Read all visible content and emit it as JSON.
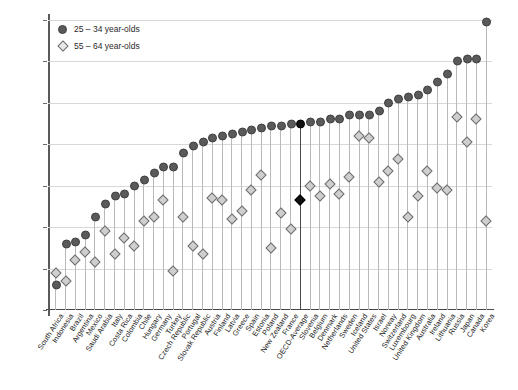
{
  "chart_data": {
    "type": "scatter",
    "title": "",
    "subtitle": "",
    "xlabel": "",
    "ylabel": "",
    "ylim": [
      0,
      70
    ],
    "yticks": [
      0,
      10,
      20,
      30,
      40,
      50,
      60,
      70
    ],
    "grid": true,
    "legend_position": "top-left",
    "highlight_category": "OECD-Average",
    "legend": [
      {
        "name": "25 – 34 year-olds",
        "marker": "filled-circle",
        "color": "#5a5a5a"
      },
      {
        "name": "55 – 64 year-olds",
        "marker": "open-diamond",
        "color": "#cfcfcf"
      }
    ],
    "categories": [
      "South Africa",
      "Indonesia",
      "Brazil",
      "Argentina",
      "Mexico",
      "Saudi Arabia",
      "Italy",
      "Costa Rica",
      "Colombia",
      "Chile",
      "Hungary",
      "Germany",
      "Turkey",
      "Czech Republic",
      "Portugal",
      "Slovak Republic",
      "Austria",
      "Finland",
      "Latvia",
      "Greece",
      "Spain",
      "Estonia",
      "Poland",
      "New Zealand",
      "France",
      "OECD-Average",
      "Slovenia",
      "Belgium",
      "Denmark",
      "Netherlands",
      "Sweden",
      "Iceland",
      "United States",
      "Israel",
      "Norway",
      "Switzerland",
      "Luxembourg",
      "United Kingdom",
      "Australia",
      "Ireland",
      "Lithuania",
      "Russia",
      "Japan",
      "Canada",
      "Korea"
    ],
    "series": [
      {
        "name": "25 – 34 year-olds",
        "marker": "filled-circle",
        "values": [
          6,
          16,
          16.5,
          18,
          22.5,
          25.5,
          27.5,
          28,
          30,
          31.5,
          33,
          34.5,
          34.5,
          38,
          39.5,
          40.5,
          41.5,
          42,
          42.5,
          43,
          43.5,
          44,
          44.5,
          44.5,
          44.8,
          44.8,
          45.5,
          45.5,
          46,
          46,
          47,
          47,
          47,
          48,
          50,
          51,
          51.5,
          52,
          53,
          55,
          57,
          60,
          60.5,
          60.5,
          69.5
        ]
      },
      {
        "name": "55 – 64 year-olds",
        "marker": "open-diamond",
        "values": [
          9,
          7,
          12,
          14,
          11.5,
          19,
          13.5,
          17.5,
          15.5,
          21.5,
          22.5,
          26.5,
          9.5,
          22.5,
          15.5,
          13.5,
          27,
          26.5,
          22,
          24,
          29,
          32.5,
          15,
          23.5,
          19.5,
          26.5,
          30,
          27.5,
          30.5,
          28,
          32,
          42,
          41.5,
          31,
          33.5,
          36.5,
          22.5,
          27.5,
          33.5,
          29.5,
          29,
          46.5,
          40.5,
          46,
          21.5
        ]
      }
    ]
  }
}
